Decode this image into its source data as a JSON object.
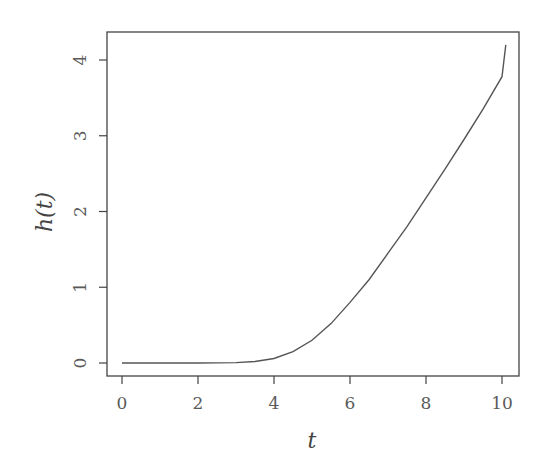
{
  "chart_data": {
    "type": "line",
    "title": "",
    "xlabel": "t",
    "ylabel": "h(t)",
    "xlim": [
      -0.4,
      10.4
    ],
    "ylim": [
      -0.07,
      4.4
    ],
    "grid": false,
    "legend": null,
    "x_ticks": [
      0,
      2,
      4,
      6,
      8,
      10
    ],
    "y_ticks": [
      0,
      1,
      2,
      3,
      4
    ],
    "series": [
      {
        "name": "h(t)",
        "color": "#555555",
        "x": [
          0,
          1,
          2,
          3,
          3.5,
          4,
          4.5,
          5,
          5.5,
          6,
          6.5,
          7,
          7.5,
          8,
          8.5,
          9,
          9.5,
          10,
          10.1
        ],
        "y": [
          0,
          0,
          0,
          0.005,
          0.02,
          0.06,
          0.15,
          0.3,
          0.52,
          0.8,
          1.1,
          1.45,
          1.8,
          2.18,
          2.56,
          2.95,
          3.35,
          3.78,
          4.2
        ]
      }
    ]
  }
}
